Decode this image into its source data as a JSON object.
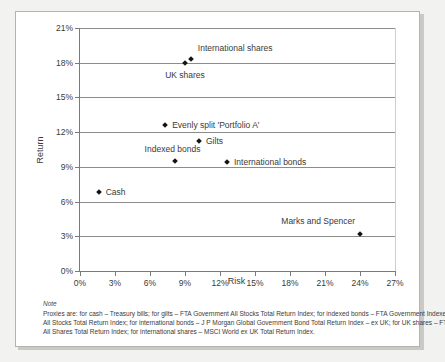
{
  "chart_data": {
    "type": "scatter",
    "title": "",
    "xlabel": "Risk",
    "ylabel": "Return",
    "xlim": [
      0,
      27
    ],
    "ylim": [
      0,
      21
    ],
    "xticks": [
      "0%",
      "3%",
      "6%",
      "9%",
      "12%",
      "15%",
      "18%",
      "21%",
      "24%",
      "27%"
    ],
    "xtick_values": [
      0,
      3,
      6,
      9,
      12,
      15,
      18,
      21,
      24,
      27
    ],
    "yticks": [
      "0%",
      "3%",
      "6%",
      "9%",
      "12%",
      "15%",
      "18%",
      "21%"
    ],
    "ytick_values": [
      0,
      3,
      6,
      9,
      12,
      15,
      18,
      21
    ],
    "grid": "horizontal",
    "legend": "none",
    "marker": "diamond",
    "marker_color": "#141414",
    "points": [
      {
        "label": "International shares",
        "x": 9.5,
        "y": 18.3,
        "label_pos": "right",
        "label_dx": 7,
        "label_dy": -11
      },
      {
        "label": "UK shares",
        "x": 9.0,
        "y": 18.0,
        "label_pos": "mid",
        "label_dx": 0,
        "label_dy": 12
      },
      {
        "label": "Evenly split 'Portfolio A'",
        "x": 7.3,
        "y": 12.6,
        "label_pos": "right",
        "label_dx": 7,
        "label_dy": 0
      },
      {
        "label": "Gilts",
        "x": 10.2,
        "y": 11.2,
        "label_pos": "right",
        "label_dx": 7,
        "label_dy": 0
      },
      {
        "label": "Indexed bonds",
        "x": 8.1,
        "y": 9.5,
        "label_pos": "mid",
        "label_dx": -2,
        "label_dy": -12
      },
      {
        "label": "International bonds",
        "x": 12.6,
        "y": 9.4,
        "label_pos": "right",
        "label_dx": 7,
        "label_dy": 0
      },
      {
        "label": "Cash",
        "x": 1.6,
        "y": 6.8,
        "label_pos": "right",
        "label_dx": 7,
        "label_dy": 0
      },
      {
        "label": "Marks and Spencer",
        "x": 24.0,
        "y": 3.2,
        "label_pos": "right",
        "label_dx": -5,
        "label_dy": -13,
        "label_anchor": "right"
      }
    ]
  },
  "note": {
    "heading": "Note",
    "lines": [
      "Proxies are: for cash – Treasury bills; for gilts – FTA Government All Stocks Total Return Index; for indexed bonds – FTA Government Indexed–Linked",
      "All Stocks Total Return Index; for international bonds – J P Morgan Global Government Bond Total Return Index – ex UK; for UK shares – FTSE",
      "All Shares Total Return Index; for international shares – MSCI World ex UK Total Return Index."
    ]
  }
}
